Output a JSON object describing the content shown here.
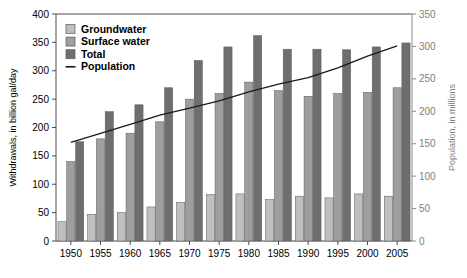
{
  "chart_data": {
    "type": "bar",
    "title": "",
    "xlabel": "",
    "ylabel": "Withdrawals, in billion gal/day",
    "y2label": "Population, in millions",
    "categories": [
      "1950",
      "1955",
      "1960",
      "1965",
      "1970",
      "1975",
      "1980",
      "1985",
      "1990",
      "1995",
      "2000",
      "2005"
    ],
    "ylim": [
      0,
      400
    ],
    "yticks": [
      0,
      50,
      100,
      150,
      200,
      250,
      300,
      350,
      400
    ],
    "y2lim": [
      0,
      350
    ],
    "y2ticks": [
      0,
      50,
      100,
      150,
      200,
      250,
      300,
      350
    ],
    "grid": false,
    "legend_position": "upper-left",
    "series": [
      {
        "name": "Groundwater",
        "axis": "left",
        "kind": "bar",
        "color": "#bfbfbf",
        "values": [
          34,
          47,
          50,
          60,
          68,
          82,
          83,
          73,
          79,
          76,
          83,
          79
        ]
      },
      {
        "name": "Surface water",
        "axis": "left",
        "kind": "bar",
        "color": "#9e9e9e",
        "values": [
          140,
          180,
          190,
          210,
          250,
          260,
          280,
          265,
          255,
          260,
          262,
          270
        ]
      },
      {
        "name": "Total",
        "axis": "left",
        "kind": "bar",
        "color": "#6e6e6e",
        "values": [
          175,
          228,
          240,
          270,
          318,
          342,
          362,
          338,
          338,
          337,
          342,
          349
        ]
      },
      {
        "name": "Population",
        "axis": "right",
        "kind": "line",
        "color": "#1a1a1a",
        "values": [
          152,
          166,
          180,
          194,
          205,
          216,
          230,
          242,
          252,
          267,
          285,
          301
        ]
      }
    ]
  },
  "legend": {
    "items": [
      {
        "label": "Groundwater",
        "swatch": "#bfbfbf",
        "type": "box"
      },
      {
        "label": "Surface water",
        "swatch": "#9e9e9e",
        "type": "box"
      },
      {
        "label": "Total",
        "swatch": "#6e6e6e",
        "type": "box"
      },
      {
        "label": "Population",
        "swatch": "#1a1a1a",
        "type": "line"
      }
    ]
  },
  "colors": {
    "groundwater": "#bfbfbf",
    "surface_water": "#9e9e9e",
    "total": "#6e6e6e",
    "population_line": "#1a1a1a",
    "left_axis": "#4d4d4d",
    "right_axis": "#8c8c8c",
    "background": "#ffffff"
  }
}
